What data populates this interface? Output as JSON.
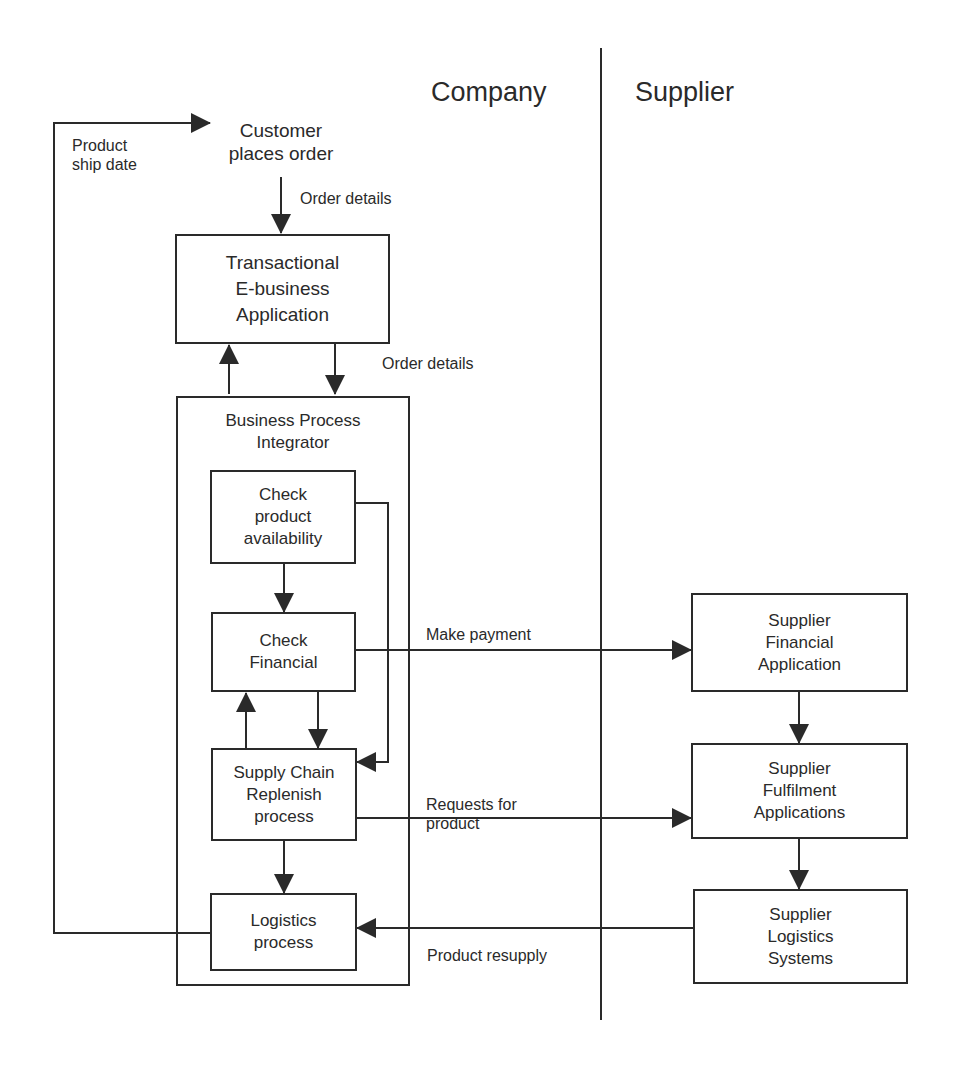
{
  "headers": {
    "company": "Company",
    "supplier": "Supplier"
  },
  "customer": {
    "label": "Customer\nplaces order"
  },
  "company_boxes": {
    "transactional": "Transactional\nE-business\nApplication",
    "integrator_title": "Business Process\nIntegrator",
    "check_availability": "Check\nproduct\navailability",
    "check_financial": "Check\nFinancial",
    "supply_chain": "Supply Chain\nReplenish\nprocess",
    "logistics": "Logistics\nprocess"
  },
  "supplier_boxes": {
    "financial": "Supplier\nFinancial\nApplication",
    "fulfilment": "Supplier\nFulfilment\nApplications",
    "logistics": "Supplier\nLogistics\nSystems"
  },
  "flow_labels": {
    "product_ship_date": "Product\nship date",
    "order_details_1": "Order details",
    "order_details_2": "Order details",
    "make_payment": "Make payment",
    "requests_for_product": "Requests for\nproduct",
    "product_resupply": "Product resupply"
  },
  "colors": {
    "line": "#2a2a2a",
    "background": "#ffffff"
  }
}
